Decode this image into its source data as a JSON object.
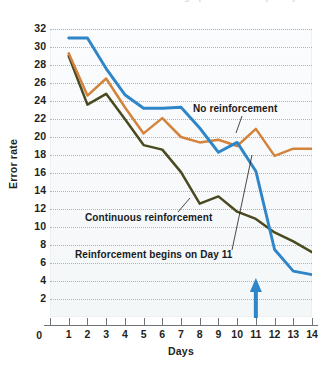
{
  "figure": {
    "top_cut_text": "reinforcement schedules can change performance quickly",
    "background": "#ffffff"
  },
  "chart_data": {
    "type": "line",
    "title": "",
    "xlabel": "Days",
    "ylabel": "Error rate",
    "xlim": [
      0,
      14
    ],
    "ylim": [
      0,
      32
    ],
    "grid": "horizontal-dotted",
    "legend": "inline-annotations",
    "x": [
      1,
      2,
      3,
      4,
      5,
      6,
      7,
      8,
      9,
      10,
      11,
      12,
      13,
      14
    ],
    "xticks": [
      "0",
      "1",
      "2",
      "3",
      "4",
      "5",
      "6",
      "7",
      "8",
      "9",
      "10",
      "11",
      "12",
      "13",
      "14"
    ],
    "yticks": [
      "2",
      "4",
      "6",
      "8",
      "10",
      "12",
      "14",
      "16",
      "18",
      "20",
      "22",
      "24",
      "26",
      "28",
      "30",
      "32"
    ],
    "y_origin_label": "0",
    "series": [
      {
        "name": "No reinforcement",
        "color": "#2e86c8",
        "values": [
          31.0,
          31.0,
          27.6,
          24.7,
          23.2,
          23.2,
          23.3,
          21.0,
          18.3,
          19.4,
          16.2,
          7.5,
          5.1,
          4.7
        ]
      },
      {
        "name": "Partial reinforcement",
        "color": "#d4833c",
        "values": [
          29.3,
          24.6,
          26.5,
          23.3,
          20.4,
          22.1,
          20.0,
          19.4,
          19.7,
          19.0,
          20.9,
          17.9,
          18.7,
          18.7
        ]
      },
      {
        "name": "Continuous reinforcement",
        "color": "#4a4a20",
        "values": [
          29.0,
          23.6,
          24.8,
          22.0,
          19.1,
          18.6,
          16.1,
          12.6,
          13.4,
          11.7,
          10.9,
          9.4,
          8.4,
          7.2
        ]
      }
    ],
    "annotations": [
      {
        "text": "No reinforcement",
        "x": 11.0,
        "y": 22.6,
        "points_to_series": "No reinforcement"
      },
      {
        "text": "Continuous reinforcement",
        "x": 5.0,
        "y": 10.9,
        "points_to_series": "Continuous reinforcement"
      },
      {
        "text": "Reinforcement begins on Day 11",
        "x": 4.0,
        "y": 7.4,
        "points_to_series": "No reinforcement"
      }
    ],
    "marker": {
      "type": "arrow-up",
      "color": "#2e86c8",
      "x": 11,
      "label": "Reinforcement begins on Day 11"
    }
  }
}
